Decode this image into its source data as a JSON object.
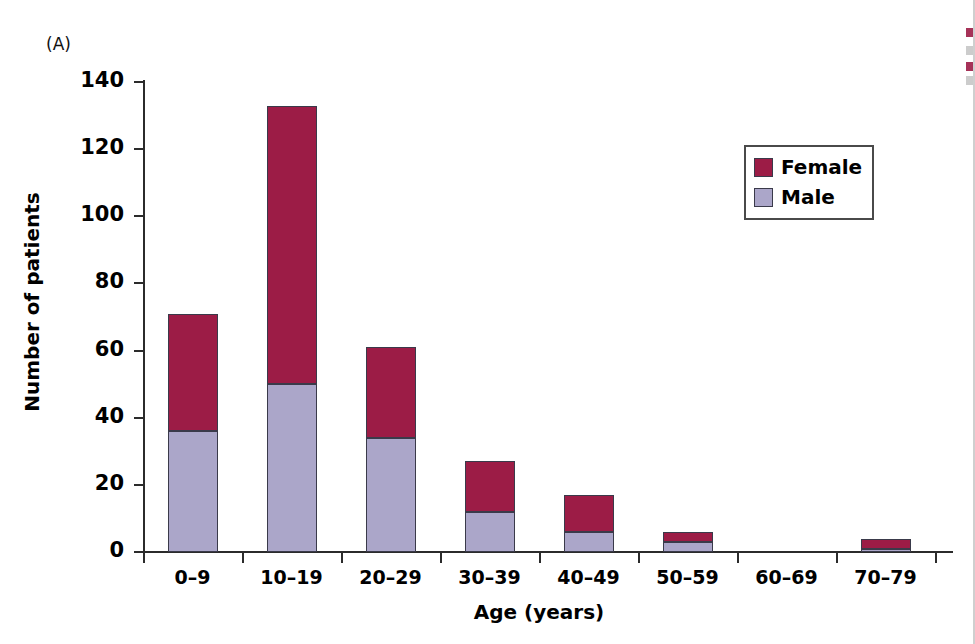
{
  "panel": {
    "label": "(A)"
  },
  "axes": {
    "y_title": "Number of patients",
    "x_title": "Age (years)",
    "y_ticks": [
      "0",
      "20",
      "40",
      "60",
      "80",
      "100",
      "120",
      "140"
    ],
    "x_ticks": [
      "0–9",
      "10–19",
      "20–29",
      "30–39",
      "40–49",
      "50–59",
      "60–69",
      "70–79"
    ]
  },
  "legend": {
    "items": [
      {
        "label": "Female",
        "color": "#9c1c46"
      },
      {
        "label": "Male",
        "color": "#aba6c9"
      }
    ]
  },
  "chart_data": {
    "type": "bar",
    "title": "(A)",
    "xlabel": "Age (years)",
    "ylabel": "Number of patients",
    "ylim": [
      0,
      140
    ],
    "ytick_step": 20,
    "grid": false,
    "stacked": true,
    "legend_position": "upper-right",
    "categories": [
      "0–9",
      "10–19",
      "20–29",
      "30–39",
      "40–49",
      "50–59",
      "60–69",
      "70–79"
    ],
    "series": [
      {
        "name": "Male",
        "color": "#aba6c9",
        "values": [
          36,
          50,
          34,
          12,
          6,
          3,
          0,
          1
        ]
      },
      {
        "name": "Female",
        "color": "#9c1c46",
        "values": [
          35,
          83,
          27,
          15,
          11,
          3,
          0,
          3
        ]
      }
    ],
    "totals": [
      71,
      133,
      61,
      27,
      17,
      6,
      0,
      4
    ]
  }
}
